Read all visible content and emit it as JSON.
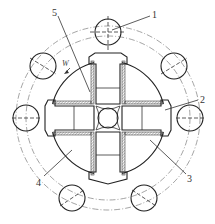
{
  "diagram": {
    "type": "mechanical-cross-section",
    "callouts": [
      {
        "id": "1",
        "label": "1"
      },
      {
        "id": "2",
        "label": "2"
      },
      {
        "id": "3",
        "label": "3"
      },
      {
        "id": "4",
        "label": "4"
      },
      {
        "id": "5",
        "label": "5"
      }
    ],
    "rotation_label": "W",
    "colors": {
      "line": "#333333",
      "hatch": "#555555",
      "background": "#ffffff"
    }
  }
}
